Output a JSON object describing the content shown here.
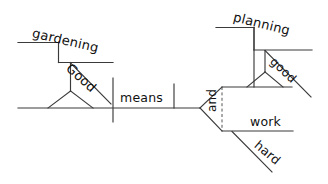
{
  "diagram": {
    "type": "reed-kellogg-sentence-diagram",
    "sentence": "Good gardening means planning and working hard.",
    "stroke_color": "#3a3a3a",
    "text_color": "#111111",
    "background_color": "#ffffff",
    "words": {
      "subject": "gardening",
      "subject_modifier": "Good",
      "verb": "means",
      "object_one": "planning",
      "object_one_modifier": "good",
      "conjunction": "and",
      "object_two": "work",
      "object_two_modifier": "hard"
    },
    "labels": [
      {
        "id": "gardening",
        "text": "gardening",
        "role": "subject"
      },
      {
        "id": "good",
        "text": "Good",
        "role": "adjective-modifier"
      },
      {
        "id": "means",
        "text": "means",
        "role": "verb"
      },
      {
        "id": "planning",
        "text": "planning",
        "role": "direct-object"
      },
      {
        "id": "good2",
        "text": "good",
        "role": "adjective-modifier"
      },
      {
        "id": "and",
        "text": "and",
        "role": "coordinating-conjunction"
      },
      {
        "id": "work",
        "text": "work",
        "role": "direct-object"
      },
      {
        "id": "hard",
        "text": "hard",
        "role": "adjective-modifier"
      }
    ]
  }
}
